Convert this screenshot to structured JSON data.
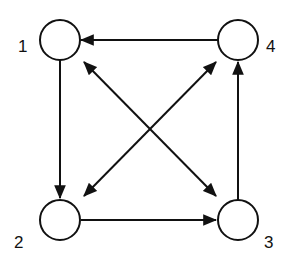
{
  "diagram": {
    "type": "directed-graph",
    "nodes": [
      {
        "id": "1",
        "label": "1",
        "cx": 60,
        "cy": 40
      },
      {
        "id": "2",
        "label": "2",
        "cx": 60,
        "cy": 220
      },
      {
        "id": "3",
        "label": "3",
        "cx": 238,
        "cy": 220
      },
      {
        "id": "4",
        "label": "4",
        "cx": 238,
        "cy": 40
      }
    ],
    "edges": [
      {
        "from": "4",
        "to": "1",
        "directed": "one-way"
      },
      {
        "from": "1",
        "to": "2",
        "directed": "one-way"
      },
      {
        "from": "2",
        "to": "3",
        "directed": "one-way"
      },
      {
        "from": "3",
        "to": "4",
        "directed": "one-way"
      },
      {
        "from": "1",
        "to": "3",
        "directed": "bidirectional"
      },
      {
        "from": "2",
        "to": "4",
        "directed": "bidirectional"
      }
    ],
    "colors": {
      "stroke": "#111111",
      "fill": "#ffffff"
    }
  }
}
